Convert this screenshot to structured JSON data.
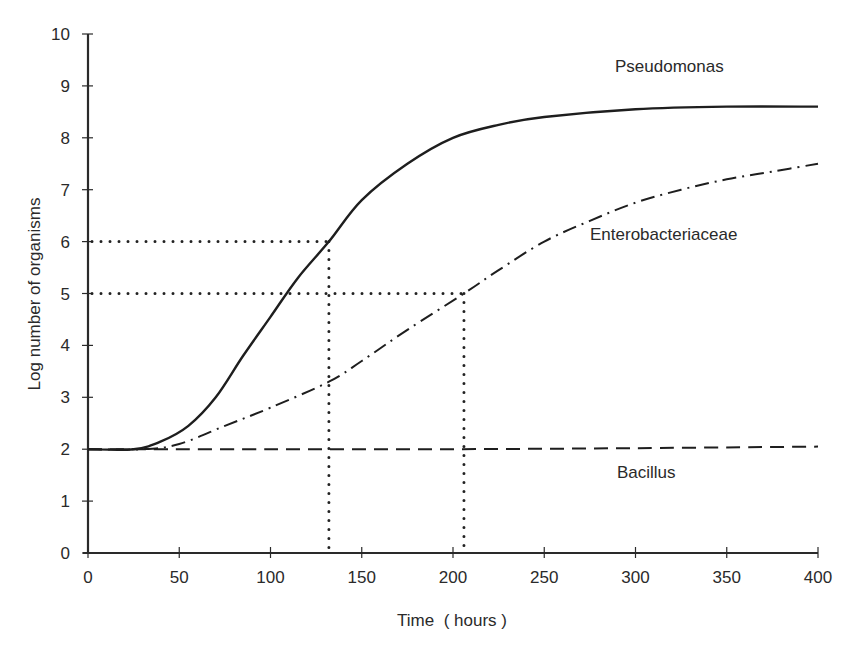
{
  "chart_data": {
    "type": "line",
    "title": "",
    "xlabel": "Time  ( hours )",
    "ylabel": "Log number of organisms",
    "xlim": [
      0,
      400
    ],
    "ylim": [
      0,
      10
    ],
    "x_ticks": [
      0,
      50,
      100,
      150,
      200,
      250,
      300,
      350,
      400
    ],
    "y_ticks": [
      0,
      1,
      2,
      3,
      4,
      5,
      6,
      7,
      8,
      9,
      10
    ],
    "grid": false,
    "legend": "inline labels next to curves",
    "series": [
      {
        "name": "Pseudomonas",
        "style": "solid",
        "x": [
          0,
          25,
          40,
          55,
          70,
          85,
          100,
          115,
          132,
          150,
          175,
          200,
          225,
          250,
          300,
          350,
          400
        ],
        "y": [
          2.0,
          2.0,
          2.15,
          2.45,
          3.0,
          3.8,
          4.55,
          5.3,
          6.0,
          6.8,
          7.5,
          8.0,
          8.25,
          8.4,
          8.55,
          8.6,
          8.6
        ]
      },
      {
        "name": "Enterobacteriaceae",
        "style": "dash-dot",
        "x": [
          0,
          30,
          50,
          75,
          100,
          132,
          150,
          175,
          206,
          225,
          250,
          275,
          300,
          325,
          350,
          375,
          400
        ],
        "y": [
          2.0,
          2.0,
          2.1,
          2.45,
          2.8,
          3.3,
          3.7,
          4.3,
          5.0,
          5.45,
          6.0,
          6.4,
          6.75,
          7.0,
          7.2,
          7.35,
          7.5
        ]
      },
      {
        "name": "Bacillus",
        "style": "dashed",
        "x": [
          0,
          100,
          200,
          300,
          400
        ],
        "y": [
          2.0,
          2.0,
          2.0,
          2.02,
          2.05
        ]
      }
    ],
    "annotations": [
      {
        "type": "dotted-reference",
        "label": "Pseudomonas reaches 6 log at ~132 h",
        "x": 132,
        "y": 6
      },
      {
        "type": "dotted-reference",
        "label": "Enterobacteriaceae reaches 5 log at ~206 h",
        "x": 206,
        "y": 5
      }
    ],
    "series_labels": [
      {
        "text": "Pseudomonas",
        "x": 615,
        "y": 72
      },
      {
        "text": "Enterobacteriaceae",
        "x": 590,
        "y": 240
      },
      {
        "text": "Bacillus",
        "x": 617,
        "y": 478
      }
    ]
  },
  "axis": {
    "x_title": "Time  ( hours )",
    "y_title": "Log number of organisms"
  }
}
